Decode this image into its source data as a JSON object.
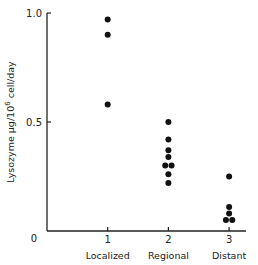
{
  "chart_data": {
    "type": "scatter",
    "title": "",
    "xlabel": "",
    "ylabel": "Lysozyme µg/10⁶ cell/day",
    "ylabel_parts": {
      "pre": "Lysozyme µg/10",
      "sup": "6",
      "post": " cell/day"
    },
    "ylim": [
      0,
      1.0
    ],
    "xlim": [
      0,
      3.3
    ],
    "yticks": [
      {
        "value": 0,
        "label": "0"
      },
      {
        "value": 0.5,
        "label": "0.5"
      },
      {
        "value": 1.0,
        "label": "1.0"
      }
    ],
    "xticks": [
      {
        "value": 1,
        "label": "1",
        "category": "Localized"
      },
      {
        "value": 2,
        "label": "2",
        "category": "Regional"
      },
      {
        "value": 3,
        "label": "3",
        "category": "Distant"
      }
    ],
    "categories": [
      "Localized",
      "Regional",
      "Distant"
    ],
    "grid": false,
    "legend": null,
    "series": [
      {
        "name": "Localized",
        "points": [
          {
            "x": 1,
            "dx": 0,
            "y": 0.97
          },
          {
            "x": 1,
            "dx": 0,
            "y": 0.9
          },
          {
            "x": 1,
            "dx": 0,
            "y": 0.58
          }
        ]
      },
      {
        "name": "Regional",
        "points": [
          {
            "x": 2,
            "dx": 0,
            "y": 0.5
          },
          {
            "x": 2,
            "dx": 0,
            "y": 0.42
          },
          {
            "x": 2,
            "dx": 0,
            "y": 0.37
          },
          {
            "x": 2,
            "dx": 0,
            "y": 0.34
          },
          {
            "x": 2,
            "dx": -0.08,
            "y": 0.3
          },
          {
            "x": 2,
            "dx": 0.08,
            "y": 0.3
          },
          {
            "x": 2,
            "dx": 0,
            "y": 0.26
          },
          {
            "x": 2,
            "dx": 0,
            "y": 0.22
          }
        ]
      },
      {
        "name": "Distant",
        "points": [
          {
            "x": 3,
            "dx": 0,
            "y": 0.25
          },
          {
            "x": 3,
            "dx": 0,
            "y": 0.11
          },
          {
            "x": 3,
            "dx": 0,
            "y": 0.08
          },
          {
            "x": 3,
            "dx": -0.08,
            "y": 0.05
          },
          {
            "x": 3,
            "dx": 0.08,
            "y": 0.05
          }
        ]
      }
    ]
  },
  "style": {
    "axis_color": "#222222",
    "dot_color": "#111111",
    "text_color": "#222222"
  }
}
